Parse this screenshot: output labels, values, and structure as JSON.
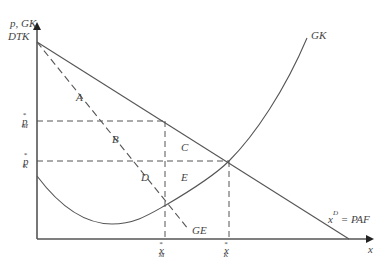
{
  "diagram": {
    "type": "economics-monopoly-vs-competition",
    "y_axis_label_line1": "p, GK",
    "y_axis_label_line2": "DTK",
    "x_axis_label": "x",
    "price_labels": {
      "p_M": {
        "base": "p",
        "sup": "*",
        "sub": "M"
      },
      "p_K": {
        "base": "p",
        "sup": "*",
        "sub": "K"
      }
    },
    "quantity_labels": {
      "x_M": {
        "base": "x",
        "sup": "*",
        "sub": "M"
      },
      "x_K": {
        "base": "x",
        "sup": "*",
        "sub": "K"
      }
    },
    "curves": {
      "marginal_cost": "GK",
      "marginal_revenue": "GE",
      "demand": {
        "base": "x",
        "sup": "D",
        "rest": " = PAF"
      }
    },
    "regions": [
      "A",
      "B",
      "C",
      "D",
      "E"
    ],
    "colors": {
      "line": "#555555",
      "text": "#444444",
      "background": "#ffffff"
    }
  }
}
